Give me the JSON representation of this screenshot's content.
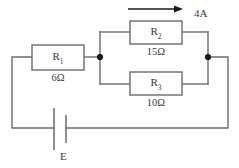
{
  "figure": {
    "type": "electrical-circuit-schematic",
    "title": "",
    "width": 239,
    "height": 168,
    "background_color": "#ffffff",
    "wire_color": "#6b6b6b",
    "text_color": "#3a3a3a",
    "node_color": "#1a1a1a"
  },
  "components": {
    "r1": {
      "name": "R",
      "subscript": "1",
      "value": "6Ω",
      "resistance": 6,
      "unit": "Ω",
      "topology": "series"
    },
    "r2": {
      "name": "R",
      "subscript": "2",
      "value": "15Ω",
      "resistance": 15,
      "unit": "Ω",
      "topology": "parallel-upper-branch"
    },
    "r3": {
      "name": "R",
      "subscript": "3",
      "value": "10Ω",
      "resistance": 10,
      "unit": "Ω",
      "topology": "parallel-lower-branch"
    },
    "source": {
      "name": "E",
      "type": "battery-emf",
      "value": ""
    }
  },
  "annotations": {
    "current": {
      "label": "4A",
      "magnitude": 4,
      "unit": "A",
      "direction": "right",
      "applies_to": "r2"
    }
  },
  "nodes": {
    "left_junction": "node-a",
    "right_junction": "node-b"
  }
}
